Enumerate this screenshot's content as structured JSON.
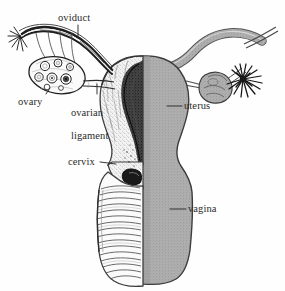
{
  "figure": {
    "caption": "",
    "background_color": "#fefefe",
    "ink_color": "#2b2b2b",
    "shade_gray": "#a8a8a8",
    "shade_gray_dark": "#8f8f8f",
    "view": "coronal section; left half cut open, right half intact exterior",
    "width": 285,
    "height": 291
  },
  "labels": [
    {
      "id": "oviduct",
      "text": "oviduct",
      "x": 58,
      "y": 12,
      "leader": "vertical-down",
      "lines": [
        "oviduct"
      ]
    },
    {
      "id": "ovary",
      "text": "ovary",
      "x": 18,
      "y": 96,
      "leader": "up-right",
      "lines": [
        "ovary"
      ]
    },
    {
      "id": "ovarian-ligament",
      "text": "ovarian ligament",
      "x": 60,
      "y": 96,
      "leader": "vertical-up",
      "lines": [
        "ovarian",
        "ligament"
      ]
    },
    {
      "id": "uterus",
      "text": "uterus",
      "x": 184,
      "y": 102,
      "leader": "horizontal-left",
      "lines": [
        "uterus"
      ]
    },
    {
      "id": "cervix",
      "text": "cervix",
      "x": 68,
      "y": 158,
      "leader": "horizontal-right",
      "lines": [
        "cervix"
      ]
    },
    {
      "id": "vagina",
      "text": "vagina",
      "x": 188,
      "y": 205,
      "leader": "horizontal-left",
      "lines": [
        "vagina"
      ]
    }
  ],
  "structures": [
    {
      "id": "oviduct-left",
      "name": "oviduct (left, sectioned)",
      "side": "left",
      "style": "line-art"
    },
    {
      "id": "fimbriae-left",
      "name": "fimbriae (left)",
      "side": "left",
      "style": "line-art"
    },
    {
      "id": "ovary-left",
      "name": "ovary (left, cut open)",
      "side": "left",
      "style": "line-art",
      "follicle_count": 7
    },
    {
      "id": "ovarian-ligament-left",
      "name": "ovarian ligament (left)",
      "side": "left",
      "style": "line-art"
    },
    {
      "id": "uterus-body",
      "name": "uterus body",
      "side": "both",
      "style": "half-section"
    },
    {
      "id": "endometrium",
      "name": "endometrium / uterine cavity",
      "side": "left",
      "style": "dark-stipple"
    },
    {
      "id": "cervix-body",
      "name": "cervix",
      "side": "both",
      "style": "half-section"
    },
    {
      "id": "vagina-canal",
      "name": "vagina with rugae",
      "side": "left",
      "style": "rugae-lines"
    },
    {
      "id": "vagina-wall",
      "name": "vagina exterior wall",
      "side": "right",
      "style": "gray-stipple"
    },
    {
      "id": "oviduct-right",
      "name": "oviduct (right, intact)",
      "side": "right",
      "style": "gray-stipple"
    },
    {
      "id": "fimbriae-right",
      "name": "fimbriae (right)",
      "side": "right",
      "style": "dark-radial"
    },
    {
      "id": "ovary-right",
      "name": "ovary (right, intact)",
      "side": "right",
      "style": "gray-stipple"
    }
  ],
  "artifacts": {
    "top_scanline": "horizontal scan line near top edge",
    "corner_smudge": "faint gray mark upper-right"
  }
}
